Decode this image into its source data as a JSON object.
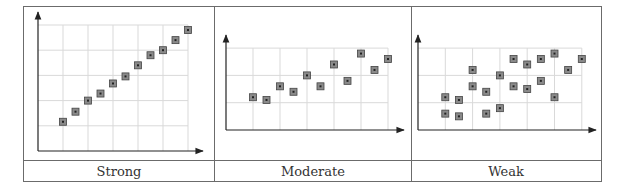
{
  "figure": {
    "border_color": "#6b6b6b",
    "grid_color": "#d9d9d9",
    "axis_color": "#222222",
    "marker_fill": "#8a8a8a",
    "marker_stroke": "#444444",
    "marker_center": "#222222"
  },
  "panels": [
    {
      "label": "Strong"
    },
    {
      "label": "Moderate"
    },
    {
      "label": "Weak"
    }
  ],
  "chart_data": [
    {
      "type": "scatter",
      "title": "Strong",
      "xlabel": "",
      "ylabel": "",
      "xlim": [
        0,
        6
      ],
      "ylim": [
        0,
        5
      ],
      "grid": true,
      "x": [
        1,
        1.5,
        2,
        2.5,
        3,
        3.5,
        4,
        4.5,
        5,
        5.5,
        6
      ],
      "y": [
        1.16,
        1.56,
        2,
        2.28,
        2.68,
        2.96,
        3.4,
        3.8,
        4,
        4.4,
        4.8
      ]
    },
    {
      "type": "scatter",
      "title": "Moderate",
      "xlabel": "",
      "ylabel": "",
      "xlim": [
        0,
        6
      ],
      "ylim": [
        0,
        3
      ],
      "grid": true,
      "x": [
        1,
        1.5,
        2,
        2.5,
        3,
        3.5,
        4,
        4.5,
        5,
        5.5,
        6
      ],
      "y": [
        1.2,
        1.1,
        1.6,
        1.4,
        2,
        1.6,
        2.4,
        1.8,
        2.8,
        2.2,
        2.6
      ]
    },
    {
      "type": "scatter",
      "title": "Weak",
      "xlabel": "",
      "ylabel": "",
      "xlim": [
        0,
        6
      ],
      "ylim": [
        0,
        3
      ],
      "grid": true,
      "x": [
        1,
        1,
        1.5,
        1.5,
        2,
        2,
        2.5,
        2.5,
        3,
        3,
        3.5,
        3.5,
        4,
        4,
        4.5,
        4.5,
        5,
        5,
        5.5,
        6
      ],
      "y": [
        1.2,
        0.6,
        1.1,
        0.5,
        2.2,
        1.6,
        1.4,
        0.6,
        2,
        0.8,
        2.6,
        1.6,
        2.4,
        1.5,
        2.6,
        1.8,
        2.8,
        1.2,
        2.2,
        2.6
      ]
    }
  ]
}
